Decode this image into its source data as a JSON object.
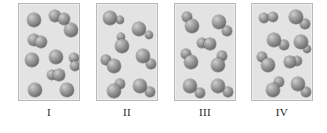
{
  "figure": {
    "title": "",
    "background_color": "#ffffff",
    "panel_fill": "#e3e3e3",
    "panel_border": "#b9b9b9",
    "atom_color": "#8a8a8a",
    "label_color": "#1d1d1d"
  },
  "chart_data": {
    "type": "diagram",
    "title": "",
    "xlabel": "",
    "ylabel": "",
    "categories": [
      "I",
      "II",
      "III",
      "IV"
    ],
    "legend": [],
    "panels": [
      {
        "label": "I",
        "x": 18,
        "y": 3,
        "width": 62,
        "height": 98,
        "single_atom_count": 7,
        "diatomic_count": 3,
        "total_particles": 10,
        "species": [
          {
            "name": "single large atom",
            "count": 7
          },
          {
            "name": "homonuclear pair of large atoms",
            "count": 3
          }
        ],
        "atoms": [
          {
            "cx": 15,
            "cy": 16,
            "r": 7.4,
            "size": "large"
          },
          {
            "cx": 36,
            "cy": 12,
            "r": 6.2,
            "size": "large"
          },
          {
            "cx": 45,
            "cy": 15,
            "r": 6.4,
            "size": "large"
          },
          {
            "cx": 52,
            "cy": 26,
            "r": 7.0,
            "size": "large"
          },
          {
            "cx": 15,
            "cy": 36,
            "r": 5.8,
            "size": "large"
          },
          {
            "cx": 22,
            "cy": 38,
            "r": 6.2,
            "size": "large"
          },
          {
            "cx": 13,
            "cy": 56,
            "r": 7.2,
            "size": "large"
          },
          {
            "cx": 37,
            "cy": 53,
            "r": 7.2,
            "size": "large"
          },
          {
            "cx": 55,
            "cy": 54,
            "r": 5.2,
            "size": "large"
          },
          {
            "cx": 56,
            "cy": 62,
            "r": 5.4,
            "size": "large"
          },
          {
            "cx": 33,
            "cy": 71,
            "r": 5.4,
            "size": "large"
          },
          {
            "cx": 40,
            "cy": 71,
            "r": 5.6,
            "size": "large"
          },
          {
            "cx": 16,
            "cy": 86,
            "r": 7.2,
            "size": "large"
          },
          {
            "cx": 48,
            "cy": 86,
            "r": 6.8,
            "size": "large"
          }
        ]
      },
      {
        "label": "II",
        "x": 96,
        "y": 3,
        "width": 62,
        "height": 98,
        "molecule_count": 7,
        "total_particles": 7,
        "species": [
          {
            "name": "heteronuclear molecule (large atom + small atom)",
            "count": 7
          }
        ],
        "atoms": [
          {
            "cx": 13,
            "cy": 14,
            "r": 7.0,
            "size": "large"
          },
          {
            "cx": 23,
            "cy": 16,
            "r": 4.4,
            "size": "small"
          },
          {
            "cx": 24,
            "cy": 33,
            "r": 4.4,
            "size": "small"
          },
          {
            "cx": 25,
            "cy": 42,
            "r": 7.0,
            "size": "large"
          },
          {
            "cx": 42,
            "cy": 25,
            "r": 7.2,
            "size": "large"
          },
          {
            "cx": 52,
            "cy": 31,
            "r": 4.4,
            "size": "small"
          },
          {
            "cx": 9,
            "cy": 56,
            "r": 4.6,
            "size": "small"
          },
          {
            "cx": 17,
            "cy": 62,
            "r": 7.2,
            "size": "large"
          },
          {
            "cx": 46,
            "cy": 52,
            "r": 7.2,
            "size": "large"
          },
          {
            "cx": 54,
            "cy": 60,
            "r": 4.6,
            "size": "small"
          },
          {
            "cx": 23,
            "cy": 80,
            "r": 4.6,
            "size": "small"
          },
          {
            "cx": 17,
            "cy": 87,
            "r": 7.2,
            "size": "large"
          },
          {
            "cx": 43,
            "cy": 82,
            "r": 7.2,
            "size": "large"
          },
          {
            "cx": 53,
            "cy": 88,
            "r": 4.6,
            "size": "small"
          }
        ]
      },
      {
        "label": "III",
        "x": 174,
        "y": 3,
        "width": 62,
        "height": 98,
        "molecule_count": 7,
        "total_particles": 7,
        "species": [
          {
            "name": "heteronuclear molecule (large atom + small atom)",
            "count": 7
          }
        ],
        "atoms": [
          {
            "cx": 12,
            "cy": 13,
            "r": 4.6,
            "size": "small"
          },
          {
            "cx": 17,
            "cy": 22,
            "r": 7.0,
            "size": "large"
          },
          {
            "cx": 44,
            "cy": 18,
            "r": 7.2,
            "size": "large"
          },
          {
            "cx": 52,
            "cy": 27,
            "r": 4.6,
            "size": "small"
          },
          {
            "cx": 27,
            "cy": 39,
            "r": 4.8,
            "size": "small"
          },
          {
            "cx": 35,
            "cy": 40,
            "r": 5.6,
            "size": "large"
          },
          {
            "cx": 11,
            "cy": 50,
            "r": 4.6,
            "size": "small"
          },
          {
            "cx": 16,
            "cy": 58,
            "r": 7.0,
            "size": "large"
          },
          {
            "cx": 47,
            "cy": 52,
            "r": 4.6,
            "size": "small"
          },
          {
            "cx": 43,
            "cy": 61,
            "r": 7.2,
            "size": "large"
          },
          {
            "cx": 15,
            "cy": 82,
            "r": 7.0,
            "size": "large"
          },
          {
            "cx": 25,
            "cy": 89,
            "r": 4.6,
            "size": "small"
          },
          {
            "cx": 43,
            "cy": 82,
            "r": 7.2,
            "size": "large"
          },
          {
            "cx": 53,
            "cy": 88,
            "r": 4.6,
            "size": "small"
          }
        ]
      },
      {
        "label": "IV",
        "x": 251,
        "y": 3,
        "width": 62,
        "height": 98,
        "molecule_count": 7,
        "total_particles": 7,
        "species": [
          {
            "name": "heteronuclear molecule (large atom + small atom)",
            "count": 7
          }
        ],
        "atoms": [
          {
            "cx": 12,
            "cy": 14,
            "r": 5.2,
            "size": "large"
          },
          {
            "cx": 21,
            "cy": 13,
            "r": 5.4,
            "size": "large"
          },
          {
            "cx": 44,
            "cy": 13,
            "r": 6.6,
            "size": "large"
          },
          {
            "cx": 53,
            "cy": 20,
            "r": 4.6,
            "size": "small"
          },
          {
            "cx": 22,
            "cy": 36,
            "r": 7.0,
            "size": "large"
          },
          {
            "cx": 32,
            "cy": 41,
            "r": 4.6,
            "size": "small"
          },
          {
            "cx": 49,
            "cy": 38,
            "r": 6.6,
            "size": "large"
          },
          {
            "cx": 55,
            "cy": 45,
            "r": 4.4,
            "size": "small"
          },
          {
            "cx": 10,
            "cy": 53,
            "r": 4.6,
            "size": "small"
          },
          {
            "cx": 16,
            "cy": 61,
            "r": 7.0,
            "size": "large"
          },
          {
            "cx": 38,
            "cy": 58,
            "r": 5.6,
            "size": "large"
          },
          {
            "cx": 45,
            "cy": 57,
            "r": 5.2,
            "size": "large"
          },
          {
            "cx": 27,
            "cy": 78,
            "r": 4.6,
            "size": "small"
          },
          {
            "cx": 21,
            "cy": 86,
            "r": 7.0,
            "size": "large"
          },
          {
            "cx": 46,
            "cy": 80,
            "r": 7.0,
            "size": "large"
          },
          {
            "cx": 54,
            "cy": 88,
            "r": 4.6,
            "size": "small"
          }
        ]
      }
    ]
  },
  "labels": [
    {
      "text": "I",
      "x": 18,
      "y": 106,
      "width": 62
    },
    {
      "text": "II",
      "x": 96,
      "y": 106,
      "width": 62
    },
    {
      "text": "III",
      "x": 174,
      "y": 106,
      "width": 62
    },
    {
      "text": "IV",
      "x": 251,
      "y": 106,
      "width": 62
    }
  ]
}
